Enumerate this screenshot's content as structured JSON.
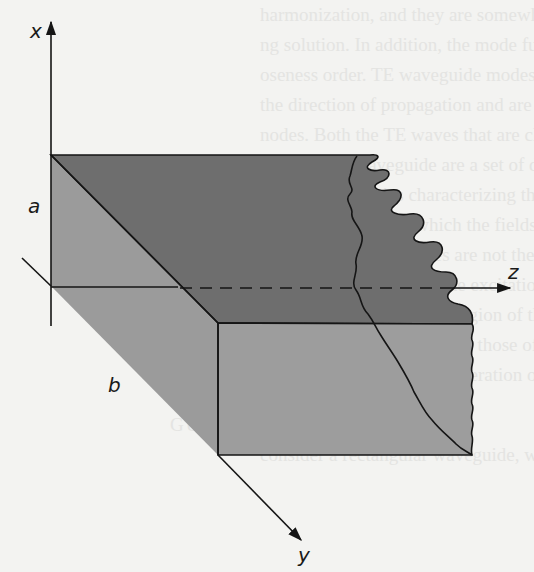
{
  "figure": {
    "type": "rectangular-waveguide-3d-sketch",
    "axes": {
      "x_label": "x",
      "y_label": "y",
      "z_label": "z"
    },
    "dimensions": {
      "a_label": "a",
      "b_label": "b"
    },
    "colors": {
      "top_face": "#6e6e6e",
      "side_face": "#9b9b9b",
      "front_face": "#9d9d9d",
      "outline": "#151515",
      "background": "#f3f3f1"
    }
  },
  "show_through_text": {
    "lines": [
      "harmonization, and they are somewhat liable",
      "ng solution. In addition, the mode functions",
      "oseness order. TE waveguide modes have no",
      "the direction of propagation and are called",
      "nodes. Both the TE waves that are characteri",
      "nsion of the waveguide are a set of dis-",
      "cut-off frequencies characterizing the TE",
      "TM or TE modes in which the fields vary",
      "ng modes. The velocities are not the same",
      "is waveguide modes by the excitation",
      "the modes in the spectral region of the",
      "he dispersion relations from those of the",
      "proper environment for generation of the source"
    ],
    "heading": "GULAR WAVEGUIDES",
    "last_line": "consider a rectangular waveguide, which we m"
  }
}
